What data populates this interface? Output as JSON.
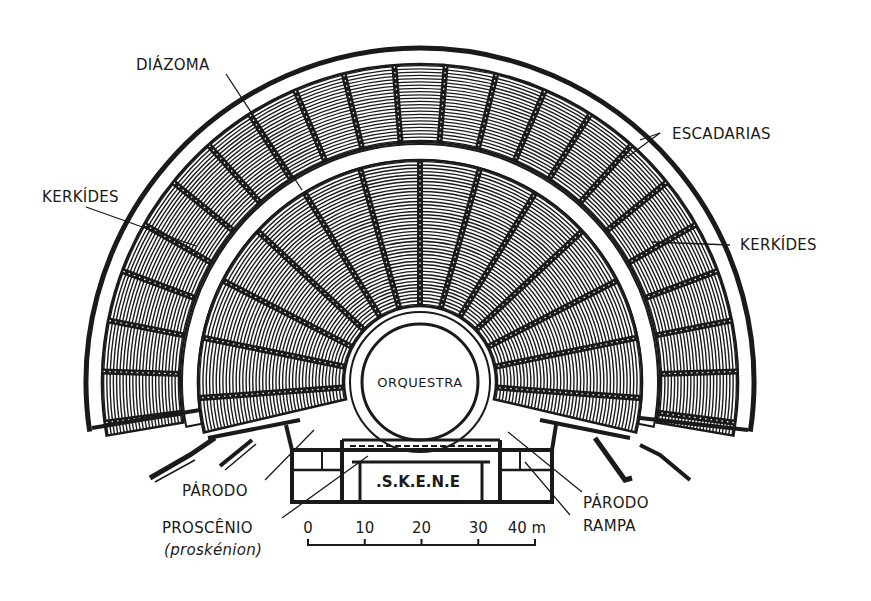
{
  "diagram": {
    "colors": {
      "ink": "#1a1a1a",
      "paper": "#ffffff"
    },
    "geometry": {
      "center": [
        420,
        382
      ],
      "orchestra_radius": 58,
      "orchestra_ring_radius": 70,
      "inner_cavea": [
        76,
        222
      ],
      "diazoma": [
        222,
        238
      ],
      "outer_cavea": [
        240,
        318
      ],
      "outer_wall": 334,
      "angle_below_horizontal_deg": 12,
      "inner_row_count": 44,
      "outer_row_count": 24,
      "inner_stair_count": 13,
      "outer_stair_count": 22
    },
    "labels": {
      "diazoma": "DIÁZOMA",
      "escadarias": "ESCADARIAS",
      "kerkides_left": "KERKÍDES",
      "kerkides_right": "KERKÍDES",
      "orquestra": "ORQUESTRA",
      "skene": ".S.K.E.N.E",
      "parodo_left": "PÁRODO",
      "parodo_right": "PÁRODO",
      "rampa": "RAMPA",
      "proscenio": "PROSCÊNIO",
      "proskenion": "(proskénion)"
    },
    "scale_bar": {
      "ticks": [
        "0",
        "10",
        "20",
        "30",
        "40 m"
      ],
      "unit": "m"
    }
  }
}
